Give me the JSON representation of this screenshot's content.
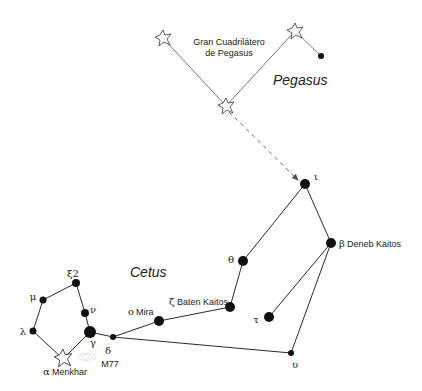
{
  "diagram": {
    "constellations": {
      "cetus_label": "Cetus",
      "pegasus_label": "Pegasus"
    },
    "asterism": {
      "line1": "Gran Cuadrilátero",
      "line2": "de Pegasus"
    },
    "stars": {
      "alpha": {
        "greek": "α",
        "name": "Menkhar"
      },
      "beta": {
        "greek": "β",
        "name": "Deneb Kaitos"
      },
      "gamma": {
        "greek": "γ"
      },
      "delta": {
        "greek": "δ"
      },
      "zeta": {
        "greek": "ζ",
        "name": "Baten Kaitos"
      },
      "theta": {
        "greek": "θ"
      },
      "iota": {
        "greek": "ι"
      },
      "lambda": {
        "greek": "λ"
      },
      "mu": {
        "greek": "μ"
      },
      "nu": {
        "greek": "ν"
      },
      "xi2": {
        "greek": "ξ2"
      },
      "omicron": {
        "greek": "o",
        "name": "Mira"
      },
      "tau": {
        "greek": "τ"
      },
      "upsilon": {
        "greek": "υ"
      }
    },
    "deep_sky": {
      "m77": "M77"
    }
  }
}
